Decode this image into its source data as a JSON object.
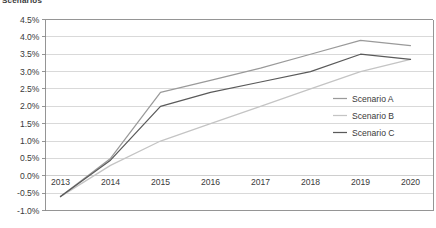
{
  "chart_data": {
    "type": "line",
    "title": "Scenarios",
    "xlabel": "",
    "ylabel": "",
    "x": [
      "2013",
      "2014",
      "2015",
      "2016",
      "2017",
      "2018",
      "2019",
      "2020"
    ],
    "categories": [
      "2013",
      "2014",
      "2015",
      "2016",
      "2017",
      "2018",
      "2019",
      "2020"
    ],
    "series": [
      {
        "name": "Scenario A",
        "color": "#9a9a9a",
        "values": [
          -0.6,
          0.5,
          2.4,
          2.75,
          3.1,
          3.5,
          3.9,
          3.75
        ]
      },
      {
        "name": "Scenario B",
        "color": "#c4c4c4",
        "values": [
          -0.6,
          0.3,
          1.0,
          1.5,
          2.0,
          2.5,
          3.0,
          3.35
        ]
      },
      {
        "name": "Scenario C",
        "color": "#5a5a5a",
        "values": [
          -0.6,
          0.45,
          2.0,
          2.4,
          2.7,
          3.0,
          3.5,
          3.35
        ]
      }
    ],
    "ylim": [
      -1.0,
      4.5
    ],
    "ystep": 0.5,
    "ytick_labels": [
      "4.5%",
      "4.0%",
      "3.5%",
      "3.0%",
      "2.5%",
      "2.0%",
      "1.5%",
      "1.0%",
      "0.5%",
      "0.0%",
      "-0.5%",
      "-1.0%"
    ],
    "ytick_values": [
      4.5,
      4.0,
      3.5,
      3.0,
      2.5,
      2.0,
      1.5,
      1.0,
      0.5,
      0.0,
      -0.5,
      -1.0
    ],
    "grid": "horizontal",
    "legend_position": "inside-right",
    "legend": [
      "Scenario A",
      "Scenario B",
      "Scenario C"
    ],
    "units": "percent"
  },
  "axis": {
    "y_labels": [
      "4.5%",
      "4.0%",
      "3.5%",
      "3.0%",
      "2.5%",
      "2.0%",
      "1.5%",
      "1.0%",
      "0.5%",
      "0.0%",
      "-0.5%",
      "-1.0%"
    ],
    "x_labels": [
      "2013",
      "2014",
      "2015",
      "2016",
      "2017",
      "2018",
      "2019",
      "2020"
    ]
  },
  "legend": {
    "items": [
      {
        "label": "Scenario A"
      },
      {
        "label": "Scenario B"
      },
      {
        "label": "Scenario C"
      }
    ]
  },
  "colors": {
    "scenario_a": "#9a9a9a",
    "scenario_b": "#c4c4c4",
    "scenario_c": "#5a5a5a",
    "gridline": "#c9c9c9",
    "axis": "#8a8a8a",
    "text": "#3a3a3a",
    "background": "#ffffff"
  }
}
